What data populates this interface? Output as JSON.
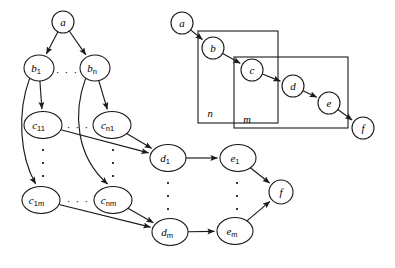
{
  "figure": {
    "width": 395,
    "height": 268,
    "background": "#ffffff",
    "ink_color": "#1a1a1a"
  },
  "left_diagram": {
    "name": "expanded-dag",
    "nodes": [
      {
        "id": "a",
        "label": "a",
        "sub": "",
        "cx": 63,
        "cy": 22,
        "rx": 11,
        "ry": 11
      },
      {
        "id": "b1",
        "label": "b",
        "sub": "1",
        "cx": 39,
        "cy": 68,
        "rx": 15,
        "ry": 13
      },
      {
        "id": "bn",
        "label": "b",
        "sub": "n",
        "cx": 95,
        "cy": 68,
        "rx": 15,
        "ry": 13
      },
      {
        "id": "c11",
        "label": "c",
        "sub": "11",
        "cx": 43,
        "cy": 125,
        "rx": 19,
        "ry": 13.5
      },
      {
        "id": "cn1",
        "label": "c",
        "sub": "n1",
        "cx": 112,
        "cy": 125,
        "rx": 19,
        "ry": 13.5
      },
      {
        "id": "c1m",
        "label": "c",
        "sub": "1m",
        "cx": 41,
        "cy": 200,
        "rx": 19,
        "ry": 13.5
      },
      {
        "id": "cnm",
        "label": "c",
        "sub": "nm",
        "cx": 113,
        "cy": 200,
        "rx": 19,
        "ry": 13.5
      },
      {
        "id": "d1",
        "label": "d",
        "sub": "1",
        "cx": 168,
        "cy": 158,
        "rx": 18,
        "ry": 13.5
      },
      {
        "id": "dm",
        "label": "d",
        "sub": "m",
        "cx": 170,
        "cy": 232,
        "rx": 18,
        "ry": 13.5
      },
      {
        "id": "e1",
        "label": "e",
        "sub": "1",
        "cx": 238,
        "cy": 158,
        "rx": 18,
        "ry": 13.5
      },
      {
        "id": "em",
        "label": "e",
        "sub": "m",
        "cx": 235,
        "cy": 231,
        "rx": 18,
        "ry": 13.5
      },
      {
        "id": "f",
        "label": "f",
        "sub": "",
        "cx": 281,
        "cy": 192,
        "rx": 12,
        "ry": 12
      }
    ],
    "edges": [
      {
        "from": "a",
        "to": "b1",
        "kind": "straight"
      },
      {
        "from": "a",
        "to": "bn",
        "kind": "straight"
      },
      {
        "from": "b1",
        "to": "c11",
        "kind": "straight"
      },
      {
        "from": "b1",
        "to": "c1m",
        "kind": "curve-left"
      },
      {
        "from": "bn",
        "to": "cn1",
        "kind": "straight"
      },
      {
        "from": "bn",
        "to": "cnm",
        "kind": "curve-left"
      },
      {
        "from": "c11",
        "to": "d1",
        "kind": "straight"
      },
      {
        "from": "cn1",
        "to": "d1",
        "kind": "straight"
      },
      {
        "from": "c1m",
        "to": "dm",
        "kind": "straight"
      },
      {
        "from": "cnm",
        "to": "dm",
        "kind": "straight"
      },
      {
        "from": "d1",
        "to": "e1",
        "kind": "straight"
      },
      {
        "from": "dm",
        "to": "em",
        "kind": "straight"
      },
      {
        "from": "e1",
        "to": "f",
        "kind": "straight"
      },
      {
        "from": "em",
        "to": "f",
        "kind": "straight"
      }
    ],
    "horizontal_ellipses": [
      {
        "id": "hdots-b",
        "text": "· · ·",
        "x": 67,
        "y": 72
      },
      {
        "id": "hdots-c1",
        "text": "· · ·",
        "x": 78,
        "y": 127
      },
      {
        "id": "hdots-cm",
        "text": "· · ·",
        "x": 78,
        "y": 201
      }
    ],
    "vertical_ellipses": [
      {
        "id": "vdots-c1",
        "x": 43,
        "y_start": 150,
        "y_end": 176
      },
      {
        "id": "vdots-cn",
        "x": 113,
        "y_start": 150,
        "y_end": 176
      },
      {
        "id": "vdots-d",
        "x": 168,
        "y_start": 183,
        "y_end": 209
      },
      {
        "id": "vdots-e",
        "x": 237,
        "y_start": 183,
        "y_end": 209
      }
    ]
  },
  "right_diagram": {
    "name": "plate-notation-dag",
    "nodes": [
      {
        "id": "ra",
        "label": "a",
        "cx": 182,
        "cy": 23,
        "rx": 11,
        "ry": 11
      },
      {
        "id": "rb",
        "label": "b",
        "cx": 213,
        "cy": 48,
        "rx": 11,
        "ry": 11
      },
      {
        "id": "rc",
        "label": "c",
        "cx": 252,
        "cy": 70,
        "rx": 11,
        "ry": 11
      },
      {
        "id": "rd",
        "label": "d",
        "cx": 293,
        "cy": 86,
        "rx": 11,
        "ry": 11
      },
      {
        "id": "re",
        "label": "e",
        "cx": 329,
        "cy": 103,
        "rx": 11,
        "ry": 11
      },
      {
        "id": "rf",
        "label": "f",
        "cx": 363,
        "cy": 128,
        "rx": 11,
        "ry": 11
      }
    ],
    "edges": [
      {
        "from": "ra",
        "to": "rb"
      },
      {
        "from": "rb",
        "to": "rc"
      },
      {
        "from": "rc",
        "to": "rd"
      },
      {
        "from": "rd",
        "to": "re"
      },
      {
        "from": "re",
        "to": "rf"
      }
    ],
    "plates": [
      {
        "id": "plate-n",
        "label": "n",
        "x": 198,
        "y": 31,
        "width": 80,
        "height": 92,
        "label_x": 210,
        "label_y": 113
      },
      {
        "id": "plate-m",
        "label": "m",
        "x": 234,
        "y": 57,
        "width": 114,
        "height": 71,
        "label_x": 247,
        "label_y": 119
      }
    ]
  }
}
